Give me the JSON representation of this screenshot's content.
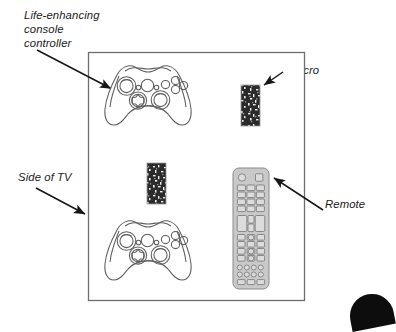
{
  "figure": {
    "kind": "line-drawing-diagram",
    "line_color": "#3a3a3a",
    "label_color": "#1a1a1a",
    "velcro_color": "#262626",
    "remote_body_color": "#c9c9c9",
    "remote_button_color": "#d9d9d9"
  },
  "labels": [
    {
      "id": "controller",
      "text": "Life-enhancing\nconsole\ncontroller",
      "points_to": "top console controller",
      "arrow": "down-right"
    },
    {
      "id": "velcro",
      "text": "Velcro",
      "points_to": "upper velcro strip",
      "arrow": "left"
    },
    {
      "id": "side_of_tv",
      "text": "Side of TV",
      "points_to": "left edge of the TV side panel",
      "arrow": "down-right"
    },
    {
      "id": "remote",
      "text": "Remote",
      "points_to": "TV remote control",
      "arrow": "up-left"
    }
  ],
  "panel": {
    "name": "side-of-tv-panel",
    "x": 88,
    "y": 52,
    "width": 217,
    "height": 249
  },
  "objects": [
    {
      "name": "console-controller-top",
      "x": 103,
      "y": 62,
      "width": 90,
      "height": 86
    },
    {
      "name": "console-controller-bottom",
      "x": 103,
      "y": 217,
      "width": 90,
      "height": 86
    },
    {
      "name": "velcro-strip-upper",
      "x": 241,
      "y": 85,
      "width": 19,
      "height": 41
    },
    {
      "name": "velcro-strip-lower",
      "x": 147,
      "y": 163,
      "width": 19,
      "height": 41
    },
    {
      "name": "tv-remote",
      "x": 233,
      "y": 168,
      "width": 36,
      "height": 121
    }
  ],
  "remote": {
    "power_button": "round",
    "top_right_button": "square",
    "keypad_columns": 3,
    "keypad_rows": 4,
    "bottom_circle_rows": 2,
    "bottom_circles_per_row": 4
  },
  "page_corner": {
    "name": "page-corner-mark",
    "shape": "dark-rounded-tab"
  }
}
